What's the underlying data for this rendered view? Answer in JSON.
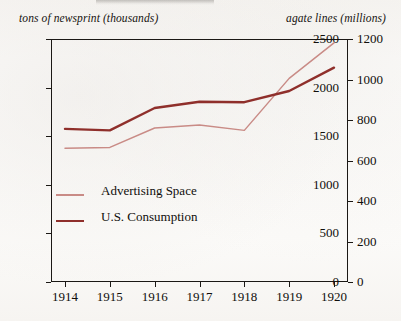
{
  "chart_data": {
    "type": "line",
    "title": "",
    "subtitle": "",
    "xlabel": "",
    "ylabel": "tons of newsprint (thousands)",
    "y2label": "agate lines (millions)",
    "grid": false,
    "legend_position": "inside-lower-left",
    "x": [
      "1914",
      "1915",
      "1916",
      "1917",
      "1918",
      "1919",
      "1920"
    ],
    "xtick_labels": [
      "1914",
      "1915",
      "1916",
      "1917",
      "1918",
      "1919",
      "1920"
    ],
    "ylim": [
      0,
      2500
    ],
    "ytick_labels": [
      "0",
      "500",
      "1000",
      "1500",
      "2000",
      "2500"
    ],
    "ytick_values": [
      0,
      500,
      1000,
      1500,
      2000,
      2500
    ],
    "y2lim": [
      0,
      1200
    ],
    "y2tick_labels": [
      "0",
      "200",
      "400",
      "600",
      "800",
      "1000",
      "1200"
    ],
    "y2tick_values": [
      0,
      200,
      400,
      600,
      800,
      1000,
      1200
    ],
    "series": [
      {
        "name": "Advertising Space",
        "axis": "right",
        "color": "#c98b86",
        "width": 1.5,
        "unit": "agate lines (millions)",
        "values_axis_right": [
          660,
          665,
          760,
          775,
          750,
          1005,
          1180
        ],
        "values": [
          1375,
          1385,
          1585,
          1615,
          1560,
          2095,
          2460
        ]
      },
      {
        "name": "U.S. Consumption",
        "axis": "left",
        "color": "#8f2f2b",
        "width": 2.4,
        "unit": "tons of newsprint (thousands)",
        "values": [
          1575,
          1560,
          1790,
          1855,
          1850,
          1965,
          2205
        ],
        "values_axis_right": [
          756,
          749,
          859,
          890,
          888,
          943,
          1058
        ]
      }
    ]
  },
  "captions": {
    "left": "tons of newsprint (thousands)",
    "right": "agate lines (millions)"
  },
  "legend": {
    "items": [
      {
        "label": "Advertising Space",
        "color": "#c98b86",
        "width": 1.5
      },
      {
        "label": "U.S. Consumption",
        "color": "#8f2f2b",
        "width": 2.4
      }
    ]
  },
  "colors": {
    "advertising_space": "#c98b86",
    "us_consumption": "#8f2f2b",
    "axis": "#1b1815",
    "text": "#100e0b",
    "paper": "#fbfaf8"
  }
}
